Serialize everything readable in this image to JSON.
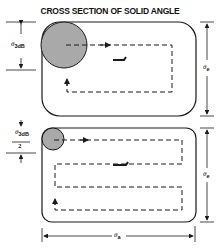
{
  "title": "CROSS SECTION OF SOLID ANGLE",
  "labels": {
    "beamwidth_top": "θ",
    "beamwidth_top_sub": "3dB",
    "beamwidth_bottom_num": "θ",
    "beamwidth_bottom_sub": "3dB",
    "beamwidth_bottom_den": "2",
    "elevation_top": "θ",
    "elevation_top_sub": "e",
    "elevation_bottom": "θ",
    "elevation_bottom_sub": "e",
    "azimuth": "θ",
    "azimuth_sub": "a"
  },
  "panels": [
    {
      "name": "coarse-scan",
      "beam": "large circle θ3dB",
      "scan_lines": 2
    },
    {
      "name": "fine-scan",
      "beam": "small circle θ3dB/2",
      "scan_lines": 4
    }
  ],
  "colors": {
    "beam_fill": "#a9a9a9",
    "line": "#1a1a1a"
  }
}
